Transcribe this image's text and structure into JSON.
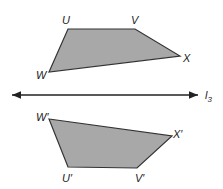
{
  "diagram": {
    "type": "reflection",
    "line": {
      "label": "l",
      "subscript": "3"
    },
    "original": {
      "vertices": [
        {
          "name": "U",
          "label": "U"
        },
        {
          "name": "V",
          "label": "V"
        },
        {
          "name": "X",
          "label": "X"
        },
        {
          "name": "W",
          "label": "W"
        }
      ]
    },
    "image": {
      "vertices": [
        {
          "name": "W'",
          "label": "W′"
        },
        {
          "name": "X'",
          "label": "X′"
        },
        {
          "name": "V'",
          "label": "V′"
        },
        {
          "name": "U'",
          "label": "U′"
        }
      ]
    },
    "colors": {
      "fill": "#a8a8a8",
      "stroke": "#333333",
      "line": "#222222"
    }
  }
}
